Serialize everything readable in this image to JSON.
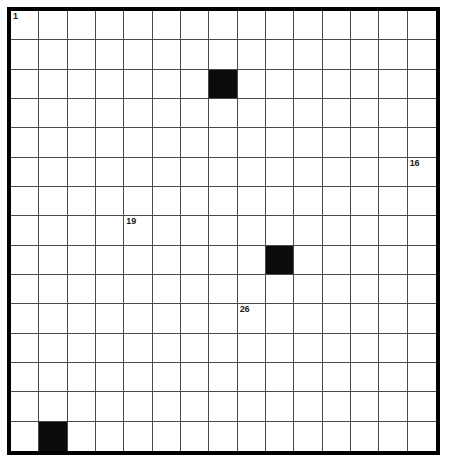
{
  "puzzle": {
    "title": "Crossword Grid",
    "type": "crossword-grid",
    "columns": 15,
    "rows": 15,
    "background_color": "#ffffff",
    "block_color": "#0b0b0b",
    "grid_line_color": "#4a4a4a",
    "frame_color": "#000000",
    "number_color": "#1a1a1a",
    "blocks": [
      {
        "row": 2,
        "col": 7
      },
      {
        "row": 8,
        "col": 9
      },
      {
        "row": 14,
        "col": 1
      }
    ],
    "numbers": [
      {
        "row": 0,
        "col": 0,
        "label": "1"
      },
      {
        "row": 5,
        "col": 14,
        "label": "16"
      },
      {
        "row": 7,
        "col": 4,
        "label": "19"
      },
      {
        "row": 10,
        "col": 8,
        "label": "26"
      }
    ],
    "letters": []
  }
}
